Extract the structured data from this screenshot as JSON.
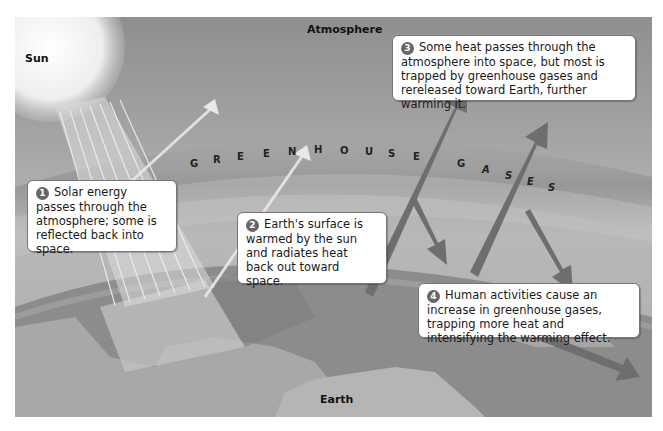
{
  "labels": {
    "sun": "Sun",
    "atmosphere": "Atmosphere",
    "earth": "Earth"
  },
  "greenhouse_letters": [
    "G",
    "R",
    "E",
    "E",
    "N",
    "H",
    "O",
    "U",
    "S",
    "E",
    "G",
    "A",
    "S",
    "E",
    "S"
  ],
  "greenhouse_text": "GREENHOUSE GASES",
  "steps": [
    {
      "number": "1",
      "text": "Solar energy passes through the atmosphere; some is reflected back into space."
    },
    {
      "number": "2",
      "text": "Earth's surface is warmed by the sun and radiates heat back out toward space."
    },
    {
      "number": "3",
      "text": "Some heat passes through the atmosphere into space, but most is trapped by greenhouse gases and rereleased toward Earth, further warming it."
    },
    {
      "number": "4",
      "text": "Human activities cause an increase in greenhouse gases, trapping more heat and intensifying the warming effect."
    }
  ],
  "colors": {
    "sky": "#9a9a9a",
    "sun": "#f4f4f4",
    "earth_ocean": "#8a8a8a",
    "earth_land": "#b4b4b4",
    "arrow_dark": "#6e6e6e",
    "callout_bg": "#ffffff"
  }
}
